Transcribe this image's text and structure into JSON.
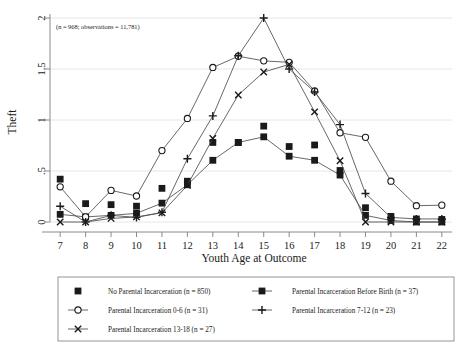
{
  "chart_data": {
    "type": "line",
    "title": "",
    "xlabel": "Youth Age at Outcome",
    "ylabel": "Theft",
    "annotation": "(n = 968; observations = 11,781)",
    "x": [
      7,
      8,
      9,
      10,
      11,
      12,
      13,
      14,
      15,
      16,
      17,
      18,
      19,
      20,
      21,
      22
    ],
    "xlim": [
      6.6,
      22.4
    ],
    "ylim": [
      0,
      2
    ],
    "xticks": [
      "7",
      "8",
      "9",
      "10",
      "11",
      "12",
      "13",
      "14",
      "15",
      "16",
      "17",
      "18",
      "19",
      "20",
      "21",
      "22"
    ],
    "yticks": [
      "0",
      ".5",
      "1",
      "1.5",
      "2"
    ],
    "ytick_values": [
      0,
      0.5,
      1,
      1.5,
      2
    ],
    "grid": true,
    "legend_position": "bottom",
    "series": [
      {
        "name": "No Parental Incarceration",
        "n": 850,
        "label": "No Parental Incarceration (n = 850)",
        "marker": "filled-square",
        "line": false,
        "values": [
          0.42,
          0.18,
          0.17,
          0.155,
          0.33,
          0.4,
          0.78,
          0.78,
          0.94,
          0.74,
          0.755,
          0.505,
          0.14,
          0.055,
          0.03,
          0.025
        ]
      },
      {
        "name": "Parental Incarceration Before Birth",
        "n": 37,
        "label": "Parental Incarceration Before Birth (n = 37)",
        "marker": "filled-square",
        "line": true,
        "values": [
          0.075,
          0.05,
          0.065,
          0.085,
          0.185,
          0.365,
          0.605,
          0.78,
          0.835,
          0.645,
          0.605,
          0.46,
          0.065,
          0.015,
          0.0,
          0.0
        ]
      },
      {
        "name": "Parental Incarceration 0-6",
        "n": 31,
        "label": "Parental Incarceration 0-6 (n = 31)",
        "marker": "open-circle",
        "line": true,
        "values": [
          0.345,
          0.05,
          0.31,
          0.255,
          0.7,
          1.015,
          1.515,
          1.625,
          1.58,
          1.565,
          1.285,
          0.875,
          0.83,
          0.4,
          0.16,
          0.165
        ]
      },
      {
        "name": "Parental Incarceration 7-12",
        "n": 23,
        "label": "Parental Incarceration 7-12 (n = 23)",
        "marker": "plus",
        "line": true,
        "values": [
          0.155,
          0.0,
          0.065,
          0.045,
          0.095,
          0.62,
          1.04,
          1.63,
          2.0,
          1.5,
          1.275,
          0.955,
          0.28,
          0.045,
          0.03,
          0.03
        ]
      },
      {
        "name": "Parental Incarceration 13-18",
        "n": 27,
        "label": "Parental Incarceration 13-18 (n = 27)",
        "marker": "cross",
        "line": true,
        "values": [
          0.0,
          0.0,
          0.035,
          0.05,
          0.09,
          0.36,
          0.82,
          1.245,
          1.47,
          1.545,
          1.08,
          0.6,
          0.0,
          0.0,
          0.0,
          0.0
        ]
      }
    ]
  },
  "legend": {
    "items": [
      {
        "label": "No Parental Incarceration (n = 850)",
        "marker": "filled-square",
        "line": false
      },
      {
        "label": "Parental Incarceration Before Birth (n = 37)",
        "marker": "filled-square",
        "line": true
      },
      {
        "label": "Parental Incarceration 0-6 (n = 31)",
        "marker": "open-circle",
        "line": true
      },
      {
        "label": "Parental Incarceration 7-12 (n = 23)",
        "marker": "plus",
        "line": true
      },
      {
        "label": "Parental Incarceration 13-18 (n = 27)",
        "marker": "cross",
        "line": true
      }
    ]
  },
  "colors": {
    "ink": "#1a1a1a",
    "line": "#4d4d4d",
    "grid": "#e3e3e3",
    "axis": "#8a8a8a",
    "background": "#ffffff"
  }
}
